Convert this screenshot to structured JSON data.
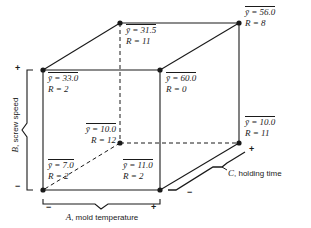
{
  "figure": {
    "type": "cube-plot",
    "vertices": [
      {
        "id": "top-back-left",
        "position": "back-top-left",
        "ybar_text": "ȳ = 31.5",
        "r_text": "R = 11",
        "ybar": 31.5,
        "r": 11,
        "codes": {
          "A": "-",
          "B": "+",
          "C": "+"
        }
      },
      {
        "id": "top-back-right",
        "position": "back-top-right",
        "ybar_text": "ȳ = 56.0",
        "r_text": "R = 8",
        "ybar": 56.0,
        "r": 8,
        "codes": {
          "A": "+",
          "B": "+",
          "C": "+"
        }
      },
      {
        "id": "top-front-left",
        "position": "front-top-left",
        "ybar_text": "ȳ = 33.0",
        "r_text": "R = 2",
        "ybar": 33.0,
        "r": 2,
        "codes": {
          "A": "-",
          "B": "+",
          "C": "-"
        }
      },
      {
        "id": "top-front-right",
        "position": "front-top-right",
        "ybar_text": "ȳ = 60.0",
        "r_text": "R = 0",
        "ybar": 60.0,
        "r": 0,
        "codes": {
          "A": "+",
          "B": "+",
          "C": "-"
        }
      },
      {
        "id": "bot-back-left",
        "position": "back-bottom-left",
        "ybar_text": "ȳ = 10.0",
        "r_text": "R = 12",
        "ybar": 10.0,
        "r": 12,
        "codes": {
          "A": "-",
          "B": "-",
          "C": "+"
        }
      },
      {
        "id": "bot-back-right",
        "position": "back-bottom-right",
        "ybar_text": "ȳ = 10.0",
        "r_text": "R = 11",
        "ybar": 10.0,
        "r": 11,
        "codes": {
          "A": "+",
          "B": "-",
          "C": "+"
        }
      },
      {
        "id": "bot-front-left",
        "position": "front-bottom-left",
        "ybar_text": "ȳ = 7.0",
        "r_text": "R = 2",
        "ybar": 7.0,
        "r": 2,
        "codes": {
          "A": "-",
          "B": "-",
          "C": "-"
        }
      },
      {
        "id": "bot-front-right",
        "position": "front-bottom-right",
        "ybar_text": "ȳ = 11.0",
        "r_text": "R = 2",
        "ybar": 11.0,
        "r": 2,
        "codes": {
          "A": "+",
          "B": "-",
          "C": "-"
        }
      }
    ],
    "axes": {
      "a": {
        "letter": "A",
        "name": ", mold temperature",
        "low": "−",
        "high": "+"
      },
      "b": {
        "letter": "B",
        "name": ", screw speed",
        "low": "−",
        "high": "+"
      },
      "c": {
        "letter": "C",
        "name": ", holding time",
        "low": "−",
        "high": "+"
      }
    },
    "colors": {
      "line": "#1a1a1a",
      "text": "#1a1a1a",
      "background": "#ffffff"
    }
  }
}
